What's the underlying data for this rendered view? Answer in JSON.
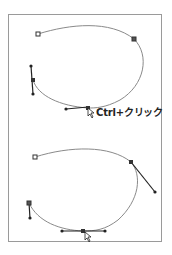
{
  "figure": {
    "annotation": "Ctrl+クリック",
    "colors": {
      "frame": "#9a9a9a",
      "curve": "#8a8a8a",
      "handle": "#222222",
      "anchor": "#333333"
    },
    "panels": [
      {
        "name": "before",
        "description": "Bezier path with anchor handles, cursor on bottom anchor"
      },
      {
        "name": "after",
        "description": "Bezier path after Ctrl+click converting anchor with extended handles"
      }
    ]
  }
}
